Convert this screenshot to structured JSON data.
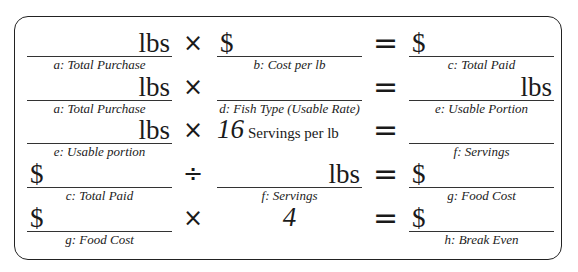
{
  "worksheet": {
    "rows": [
      {
        "left": {
          "unit": "lbs",
          "label": "a: Total Purchase"
        },
        "operator": "×",
        "middle": {
          "unit": "$",
          "label": "b: Cost per lb"
        },
        "equals": "=",
        "right": {
          "unit": "$",
          "label": "c: Total Paid"
        }
      },
      {
        "left": {
          "unit": "lbs",
          "label": "a: Total Purchase"
        },
        "operator": "×",
        "middle": {
          "unit": "",
          "label": "d: Fish Type (Usable Rate)"
        },
        "equals": "=",
        "right": {
          "unit": "lbs",
          "label": "e: Usable Portion"
        }
      },
      {
        "left": {
          "unit": "lbs",
          "label": "e: Usable portion"
        },
        "operator": "×",
        "middle": {
          "number": "16",
          "text": "Servings per lb"
        },
        "equals": "=",
        "right": {
          "unit": "",
          "label": "f: Servings"
        }
      },
      {
        "left": {
          "unit": "$",
          "label": "c: Total Paid"
        },
        "operator": "÷",
        "middle": {
          "unit": "lbs",
          "label": "f: Servings"
        },
        "equals": "=",
        "right": {
          "unit": "$",
          "label": "g: Food Cost"
        }
      },
      {
        "left": {
          "unit": "$",
          "label": "g: Food Cost"
        },
        "operator": "×",
        "middle": {
          "number": "4"
        },
        "equals": "=",
        "right": {
          "unit": "$",
          "label": "h: Break Even"
        }
      }
    ]
  }
}
